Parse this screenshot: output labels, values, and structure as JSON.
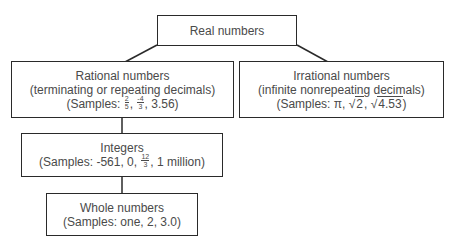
{
  "diagram": {
    "nodes": {
      "real": {
        "label": "Real numbers"
      },
      "rational": {
        "label": "Rational numbers",
        "description": "(terminating or repeating decimals)",
        "samples_prefix": "(Samples: ",
        "samples": [
          {
            "type": "fraction",
            "num": "2",
            "den": "5"
          },
          {
            "type": "fraction",
            "num": "-4",
            "den": "3"
          },
          {
            "type": "text",
            "value": "3.56"
          }
        ],
        "samples_suffix": ")"
      },
      "irrational": {
        "label": "Irrational numbers",
        "description": "(infinite nonrepeating decimals)",
        "samples_prefix": "(Samples: ",
        "samples": [
          {
            "type": "text",
            "value": "π"
          },
          {
            "type": "sqrt",
            "value": "2"
          },
          {
            "type": "sqrt",
            "value": "4.53"
          }
        ],
        "samples_suffix": ")"
      },
      "integers": {
        "label": "Integers",
        "samples_prefix": "(Samples: ",
        "samples": [
          {
            "type": "text",
            "value": "-561"
          },
          {
            "type": "text",
            "value": "0"
          },
          {
            "type": "fraction",
            "num": "12",
            "den": "3"
          },
          {
            "type": "text",
            "value": "1 million"
          }
        ],
        "samples_suffix": ")"
      },
      "whole": {
        "label": "Whole numbers",
        "samples_text": "(Samples: one, 2, 3.0)"
      }
    },
    "edges": [
      {
        "from": "real",
        "to": "rational"
      },
      {
        "from": "real",
        "to": "irrational"
      },
      {
        "from": "rational",
        "to": "integers"
      },
      {
        "from": "integers",
        "to": "whole"
      }
    ],
    "separator": ", ",
    "sqrt_symbol": "√",
    "line_color": "#2a2a2a"
  }
}
